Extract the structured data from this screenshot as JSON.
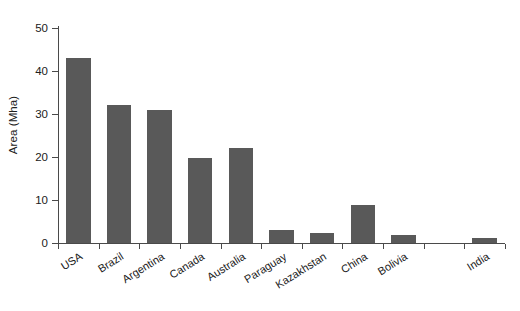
{
  "chart_data": {
    "type": "bar",
    "title": "",
    "subtitle": "",
    "xlabel": "",
    "ylabel": "Area (Mha)",
    "ylim": [
      0,
      50
    ],
    "ytick_labels": [
      "0",
      "10",
      "20",
      "30",
      "40",
      "50"
    ],
    "ytick_values": [
      0,
      10,
      20,
      30,
      40,
      50
    ],
    "grid": false,
    "legend": false,
    "bar_color": "#595959",
    "axis_color": "#4a4a4a",
    "categories": [
      "USA",
      "Brazil",
      "Argentina",
      "Canada",
      "Australia",
      "Paraguay",
      "Kazakhstan",
      "China",
      "Bolivia",
      "",
      "India"
    ],
    "values": [
      43.0,
      32.0,
      31.0,
      19.7,
      22.2,
      3.0,
      2.4,
      8.8,
      1.9,
      0,
      1.2
    ],
    "series": [
      {
        "name": "Area",
        "values": [
          43.0,
          32.0,
          31.0,
          19.7,
          22.2,
          3.0,
          2.4,
          8.8,
          1.9,
          0,
          1.2
        ]
      }
    ],
    "x_tick_count": 11
  }
}
